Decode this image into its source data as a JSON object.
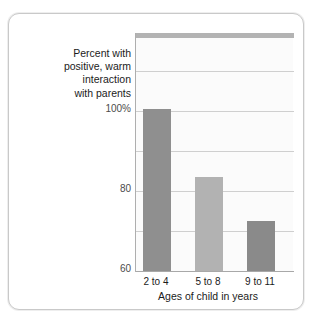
{
  "figure": {
    "y_caption_lines": [
      "Percent with",
      "positive, warm",
      "interaction",
      "with parents"
    ]
  },
  "chart_data": {
    "type": "bar",
    "title": "",
    "categories": [
      "2 to 4",
      "5 to 8",
      "9 to 11"
    ],
    "values": [
      81,
      47,
      25
    ],
    "xlabel": "Ages of child in years",
    "ylabel": "Percent with positive, warm interaction with parents",
    "ylim": [
      0,
      100
    ],
    "yticks": [
      0,
      20,
      40,
      60,
      80,
      100
    ],
    "ytick_labels": [
      "0",
      "20",
      "40",
      "60",
      "80",
      "100%"
    ],
    "grid": true,
    "legend": "none",
    "bar_colors": [
      "#8f8f8f",
      "#b2b2b2",
      "#8a8a8a"
    ],
    "plot_background": "#fbfbfb",
    "gridline_color": "#cfcfcf",
    "axis_color": "#a8a8a8",
    "header_band_color": "#b3b3b3"
  }
}
